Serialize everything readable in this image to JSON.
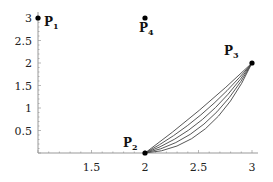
{
  "chart_data": {
    "type": "line",
    "title": "",
    "xlabel": "",
    "ylabel": "",
    "xlim": [
      1,
      3
    ],
    "ylim": [
      0,
      3
    ],
    "grid": false,
    "x_ticks": [
      "1.5",
      "2",
      "2.5",
      "3"
    ],
    "y_ticks": [
      "0.5",
      "1",
      "1.5",
      "2",
      "2.5",
      "3"
    ],
    "points": [
      {
        "name": "P",
        "sub": "1",
        "x": 1,
        "y": 3
      },
      {
        "name": "P",
        "sub": "2",
        "x": 2,
        "y": 0
      },
      {
        "name": "P",
        "sub": "3",
        "x": 3,
        "y": 2
      },
      {
        "name": "P",
        "sub": "4",
        "x": 2,
        "y": 3
      }
    ],
    "series": [
      {
        "name": "curve-1",
        "from": "P2",
        "to": "P3",
        "shape": "bezier",
        "sag": 0.1
      },
      {
        "name": "curve-2",
        "from": "P2",
        "to": "P3",
        "shape": "bezier",
        "sag": 0.3
      },
      {
        "name": "curve-3",
        "from": "P2",
        "to": "P3",
        "shape": "bezier",
        "sag": 0.5
      },
      {
        "name": "curve-4",
        "from": "P2",
        "to": "P3",
        "shape": "bezier",
        "sag": 0.7
      },
      {
        "name": "curve-5",
        "from": "P2",
        "to": "P3",
        "shape": "bezier",
        "sag": 0.9
      }
    ],
    "colors": {
      "axis": "#999999",
      "curve": "#444444",
      "point": "#000000"
    }
  }
}
